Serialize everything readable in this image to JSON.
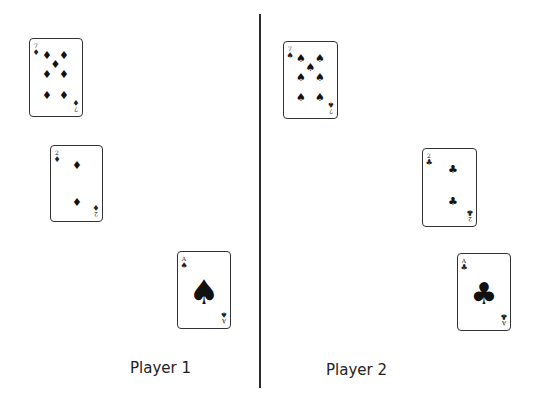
{
  "players": [
    {
      "label": "Player 1",
      "cards": [
        {
          "rank": "7",
          "suit": "♦",
          "suit_name": "diamonds"
        },
        {
          "rank": "2",
          "suit": "♦",
          "suit_name": "diamonds"
        },
        {
          "rank": "A",
          "suit": "♠",
          "suit_name": "spades"
        }
      ]
    },
    {
      "label": "Player 2",
      "cards": [
        {
          "rank": "7",
          "suit": "♠",
          "suit_name": "spades"
        },
        {
          "rank": "2",
          "suit": "♣",
          "suit_name": "clubs"
        },
        {
          "rank": "A",
          "suit": "♣",
          "suit_name": "clubs"
        }
      ]
    }
  ]
}
